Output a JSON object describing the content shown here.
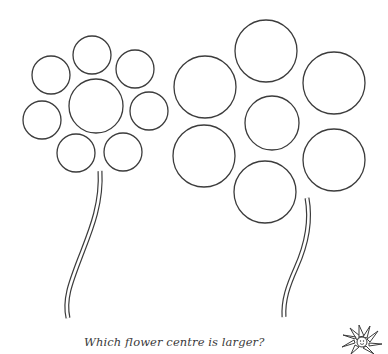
{
  "worksheet": {
    "question": "Which flower centre is larger?",
    "stroke_color": "#3c3c3c",
    "background": "#ffffff"
  },
  "flowers": [
    {
      "name": "left-flower",
      "center": {
        "cx": 96,
        "cy": 106,
        "r": 27
      },
      "petals": [
        {
          "position": "top",
          "cx": 92,
          "cy": 55,
          "r": 19
        },
        {
          "position": "top-left",
          "cx": 51,
          "cy": 75,
          "r": 19
        },
        {
          "position": "top-right",
          "cx": 135,
          "cy": 69,
          "r": 19
        },
        {
          "position": "left",
          "cx": 42,
          "cy": 120,
          "r": 19
        },
        {
          "position": "right",
          "cx": 149,
          "cy": 111,
          "r": 19
        },
        {
          "position": "bottom-left",
          "cx": 76,
          "cy": 153,
          "r": 19
        },
        {
          "position": "bottom-right",
          "cx": 123,
          "cy": 152,
          "r": 19
        }
      ],
      "stem": "M100 171 C102 205 90 232 80 258 C70 284 64 300 68 318"
    },
    {
      "name": "right-flower",
      "center": {
        "cx": 272,
        "cy": 123,
        "r": 27
      },
      "petals": [
        {
          "position": "top",
          "cx": 266,
          "cy": 51,
          "r": 31
        },
        {
          "position": "top-left",
          "cx": 205,
          "cy": 87,
          "r": 31
        },
        {
          "position": "top-right",
          "cx": 334,
          "cy": 83,
          "r": 31
        },
        {
          "position": "bottom-left",
          "cx": 204,
          "cy": 156,
          "r": 31
        },
        {
          "position": "bottom-right",
          "cx": 334,
          "cy": 160,
          "r": 31
        },
        {
          "position": "bottom",
          "cx": 265,
          "cy": 192,
          "r": 31
        }
      ],
      "stem": "M307 198 C312 225 305 248 296 268 C288 286 283 300 284 317"
    }
  ],
  "icons": {
    "corner_decoration": "daisy-icon"
  }
}
